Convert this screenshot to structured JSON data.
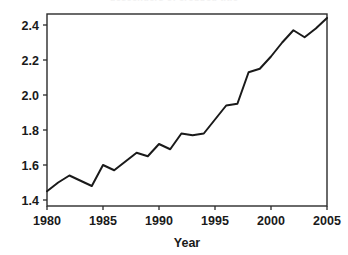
{
  "page": {
    "background_color": "#ffffff",
    "clipped_top_text": "descenders of cropped title"
  },
  "chart_data": {
    "type": "line",
    "title": "",
    "xlabel": "Year",
    "ylabel": "",
    "xlim": [
      1980,
      2005
    ],
    "ylim": [
      1.4,
      2.5
    ],
    "grid": false,
    "legend": "none",
    "line_color": "#1a1a1a",
    "frame_color": "#2b2b2b",
    "x_ticks": [
      1980,
      1985,
      1990,
      1995,
      2000,
      2005
    ],
    "x_tick_labels": [
      "1980",
      "1985",
      "1990",
      "1995",
      "2000",
      "2005"
    ],
    "y_ticks": [
      1.4,
      1.6,
      1.8,
      2.0,
      2.2,
      2.4
    ],
    "y_tick_labels": [
      "1.4",
      "1.6",
      "1.8",
      "2.0",
      "2.2",
      "2.4"
    ],
    "x": [
      1980,
      1981,
      1982,
      1983,
      1984,
      1985,
      1986,
      1987,
      1988,
      1989,
      1990,
      1991,
      1992,
      1993,
      1994,
      1995,
      1996,
      1997,
      1998,
      1999,
      2000,
      2001,
      2002,
      2003,
      2004,
      2005
    ],
    "values": [
      1.45,
      1.5,
      1.54,
      1.51,
      1.48,
      1.6,
      1.57,
      1.62,
      1.67,
      1.65,
      1.72,
      1.69,
      1.78,
      1.77,
      1.78,
      1.86,
      1.94,
      1.95,
      2.13,
      2.15,
      2.22,
      2.3,
      2.37,
      2.33,
      2.38,
      2.44
    ],
    "series": [
      {
        "name": "series-1",
        "values": [
          1.45,
          1.5,
          1.54,
          1.51,
          1.48,
          1.6,
          1.57,
          1.62,
          1.67,
          1.65,
          1.72,
          1.69,
          1.78,
          1.77,
          1.78,
          1.86,
          1.94,
          1.95,
          2.13,
          2.15,
          2.22,
          2.3,
          2.37,
          2.33,
          2.38,
          2.44
        ]
      }
    ]
  }
}
